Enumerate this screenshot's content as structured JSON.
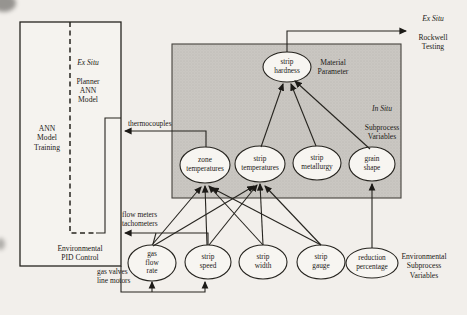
{
  "left_box": {
    "training_label": "ANN\nModel\nTraining",
    "planner_title": "Ex Situ",
    "planner_label": "Planner\nANN\nModel",
    "pid_label": "Environmental\nPID Control"
  },
  "sensors": {
    "thermocouples": "thermocouples",
    "flow_meters": "flow meters\ntachometers",
    "actuators": "gas valves\nline motors"
  },
  "region": {
    "material_parameter": "Material\nParameter",
    "in_situ_title": "In Situ",
    "in_situ_label": "Subprocess\nVariables"
  },
  "output": {
    "rockwell_title": "Ex Situ",
    "rockwell_label": "Rockwell\nTesting"
  },
  "nodes": {
    "strip_hardness": "strip\nhardness",
    "zone_temperatures": "zone\ntemperatures",
    "strip_temperatures": "strip\ntemperatures",
    "strip_metallurgy": "strip\nmetallurgy",
    "grain_shape": "grain\nshape",
    "gas_flow_rate": "gas\nflow\nrate",
    "strip_speed": "strip\nspeed",
    "strip_width": "strip\nwidth",
    "strip_gauge": "strip\ngauge",
    "reduction_percentage": "reduction\npercentage"
  },
  "env_subprocess_label": "Environmental\nSubprocess\nVariables",
  "colors": {
    "shaded_region": "#cac7c2",
    "line": "#26241f",
    "paper": "#f2efeb"
  }
}
